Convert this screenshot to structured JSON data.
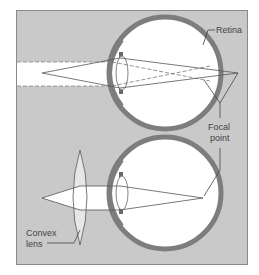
{
  "figure": {
    "labels": {
      "retina": "Retina",
      "focal_point_line1": "Focal",
      "focal_point_line2": "point",
      "convex_lens_line1": "Convex",
      "convex_lens_line2": "lens"
    },
    "panels": [
      {
        "name": "uncorrected-eye",
        "description": "Light focuses behind the retina"
      },
      {
        "name": "corrected-eye",
        "description": "Convex lens brings focal point onto the retina"
      }
    ],
    "colors": {
      "background": "#c9c9c9",
      "sclera": "#7d7d7d",
      "eye_interior": "#ffffff",
      "lines": "#555555"
    }
  }
}
